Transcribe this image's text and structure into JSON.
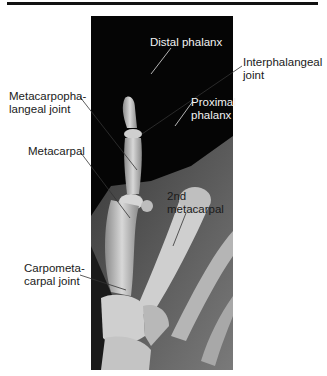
{
  "figure": {
    "title_rule": true,
    "image_description": "Radiograph of hand showing thumb bones",
    "labels": {
      "distal_phalanx": "Distal phalanx",
      "interphalangeal_joint": [
        "Interphalangeal",
        "joint"
      ],
      "proximal_phalanx": [
        "Proximal",
        "phalanx"
      ],
      "metacarpophalangeal_joint": [
        "Metacarpopha-",
        "langeal joint"
      ],
      "metacarpal": "Metacarpal",
      "second_metacarpal": [
        "2nd",
        "metacarpal"
      ],
      "carpometacarpal_joint": [
        "Carpometa-",
        "carpal joint"
      ]
    }
  },
  "colors": {
    "background": "#ffffff",
    "xray_background": "#050505",
    "label_dark": "#1a1a1a",
    "label_light": "#f2f2f2"
  }
}
